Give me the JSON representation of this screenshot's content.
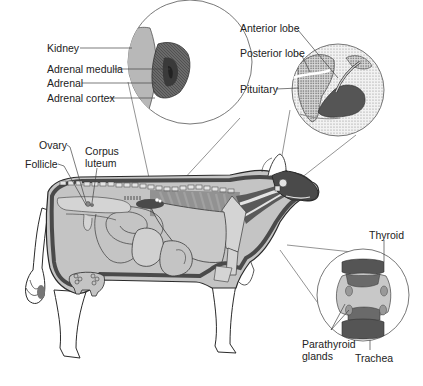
{
  "diagram": {
    "colors": {
      "background": "#ffffff",
      "body_fill": "#c4c4c4",
      "organ_dark": "#5a5a5a",
      "outline": "#2a2a2a",
      "leader_line": "#555555",
      "text": "#222222"
    },
    "insets": {
      "adrenal": {
        "labels": {
          "kidney": "Kidney",
          "adrenal_medulla": "Adrenal medulla",
          "adrenal": "Adrenal",
          "adrenal_cortex": "Adrenal cortex"
        }
      },
      "pituitary": {
        "labels": {
          "anterior_lobe": "Anterior lobe",
          "posterior_lobe": "Posterior lobe",
          "pituitary": "Pituitary"
        }
      },
      "thyroid": {
        "labels": {
          "thyroid": "Thyroid",
          "parathyroid_line1": "Parathyroid",
          "parathyroid_line2": "glands",
          "trachea": "Trachea"
        }
      }
    },
    "body_labels": {
      "ovary": "Ovary",
      "follicle": "Follicle",
      "corpus_line1": "Corpus",
      "corpus_line2": "luteum"
    }
  }
}
